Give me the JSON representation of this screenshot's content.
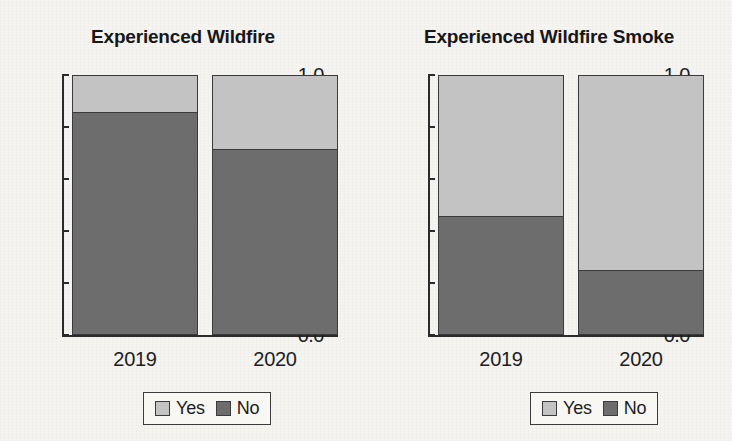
{
  "chart_data": [
    {
      "type": "bar",
      "title": "Experienced Wildfire",
      "xlabel": "",
      "ylabel": "",
      "categories": [
        "2019",
        "2020"
      ],
      "series": [
        {
          "name": "Yes",
          "values": [
            0.145,
            0.288
          ],
          "color": "#c3c3c3"
        },
        {
          "name": "No",
          "values": [
            0.855,
            0.712
          ],
          "color": "#6d6d6d"
        }
      ],
      "stacked": true,
      "ylim": [
        0.0,
        1.0
      ],
      "yticks": [
        "1.0",
        "0.8",
        "0.6",
        "0.4",
        "0.2",
        "0.0"
      ],
      "ytick_values": [
        1.0,
        0.8,
        0.6,
        0.4,
        0.2,
        0.0
      ],
      "grid": false,
      "legend_position": "bottom",
      "legend_entries": [
        "Yes",
        "No"
      ]
    },
    {
      "type": "bar",
      "title": "Experienced Wildfire Smoke",
      "xlabel": "",
      "ylabel": "",
      "categories": [
        "2019",
        "2020"
      ],
      "series": [
        {
          "name": "Yes",
          "values": [
            0.545,
            0.755
          ],
          "color": "#c3c3c3"
        },
        {
          "name": "No",
          "values": [
            0.455,
            0.245
          ],
          "color": "#6d6d6d"
        }
      ],
      "stacked": true,
      "ylim": [
        0.0,
        1.0
      ],
      "yticks": [
        "1.0",
        "0.8",
        "0.6",
        "0.4",
        "0.2",
        "0.0"
      ],
      "ytick_values": [
        1.0,
        0.8,
        0.6,
        0.4,
        0.2,
        0.0
      ],
      "grid": false,
      "legend_position": "bottom",
      "legend_entries": [
        "Yes",
        "No"
      ]
    }
  ],
  "colors": {
    "yes": "#c3c3c3",
    "no": "#6d6d6d",
    "axis": "#2b2b2d",
    "text": "#1d1d1f",
    "background": "#f6f4f1"
  }
}
